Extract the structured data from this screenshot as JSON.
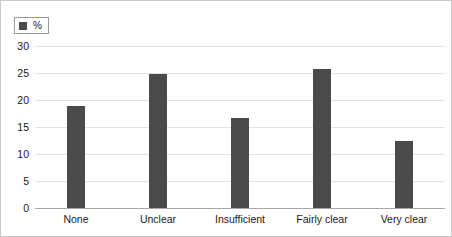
{
  "legend": {
    "swatch_name": "legend-color-swatch",
    "label": "%"
  },
  "axis": {
    "yticks": [
      "30",
      "25",
      "20",
      "15",
      "10",
      "5",
      "0"
    ]
  },
  "colors": {
    "bar": "#4a4a4a",
    "gridline": "#e2e2e2",
    "baseline": "#a8a8a8",
    "frame": "#c9c9c9",
    "text": "#1a1a1a"
  },
  "chart_data": {
    "type": "bar",
    "title": "",
    "xlabel": "",
    "ylabel": "",
    "ylim": [
      0,
      30
    ],
    "ytick_step": 5,
    "grid": true,
    "legend_position": "top-left",
    "series_name": "%",
    "categories": [
      "None",
      "Unclear",
      "Insufficient",
      "Fairly clear",
      "Very clear"
    ],
    "values": [
      18.9,
      24.9,
      16.7,
      25.7,
      12.5
    ]
  }
}
